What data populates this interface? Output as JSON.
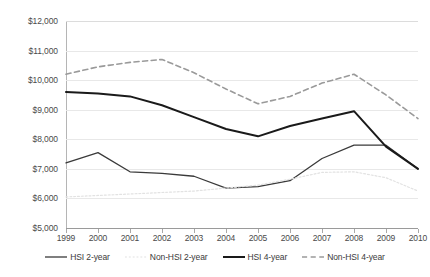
{
  "chart_data": {
    "type": "line",
    "title": "",
    "xlabel": "",
    "ylabel": "",
    "x": [
      1999,
      2000,
      2001,
      2002,
      2003,
      2004,
      2005,
      2006,
      2007,
      2008,
      2009,
      2010
    ],
    "categories": [
      "1999",
      "2000",
      "2001",
      "2002",
      "2003",
      "2004",
      "2005",
      "2006",
      "2007",
      "2008",
      "2009",
      "2010"
    ],
    "ylim": [
      5000,
      12000
    ],
    "ytick_values": [
      5000,
      6000,
      7000,
      8000,
      9000,
      10000,
      11000,
      12000
    ],
    "ytick_labels": [
      "$5,000",
      "$6,000",
      "$7,000",
      "$8,000",
      "$9,000",
      "$10,000",
      "$11,000",
      "$12,000"
    ],
    "grid": true,
    "legend_position": "bottom",
    "series": [
      {
        "name": "HSI 2-year",
        "style": "solid",
        "color": "#3a3a3a",
        "width": 1.3,
        "values": [
          7200,
          7550,
          6900,
          6850,
          6750,
          6350,
          6400,
          6600,
          7350,
          7800,
          7800,
          7000
        ]
      },
      {
        "name": "Non-HSI 2-year",
        "style": "dotted",
        "color": "#e2e2e2",
        "width": 1.2,
        "values": [
          6050,
          6100,
          6150,
          6200,
          6250,
          6350,
          6450,
          6650,
          6880,
          6900,
          6700,
          6250
        ]
      },
      {
        "name": "HSI 4-year",
        "style": "solid",
        "color": "#1a1a1a",
        "width": 2.0,
        "values": [
          9600,
          9550,
          9450,
          9150,
          8750,
          8350,
          8100,
          8450,
          8700,
          8950,
          7750,
          7000
        ]
      },
      {
        "name": "Non-HSI 4-year",
        "style": "dashed",
        "color": "#9a9a9a",
        "width": 1.6,
        "values": [
          10200,
          10450,
          10600,
          10700,
          10250,
          9700,
          9200,
          9450,
          9900,
          10200,
          9500,
          8700
        ]
      }
    ]
  },
  "colors": {
    "background": "#ffffff",
    "gridline": "#e8e8e8",
    "axis": "#9a9a9a",
    "tick_text": "#4a4a4a",
    "legend_text": "#3a3a3a"
  }
}
